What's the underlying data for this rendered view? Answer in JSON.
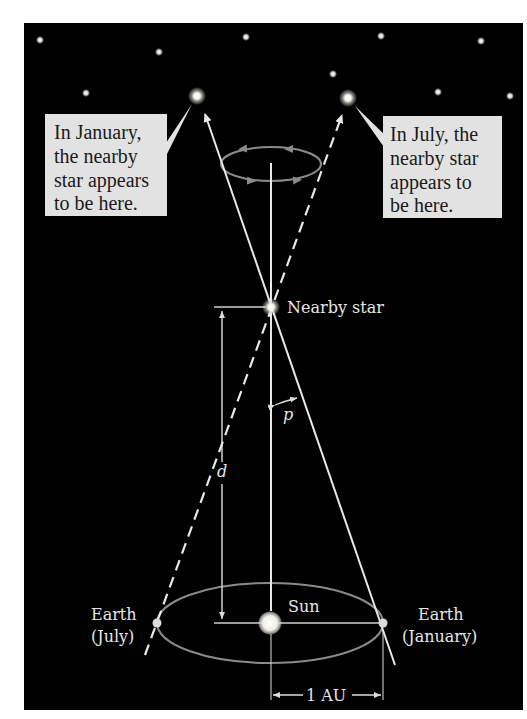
{
  "diagram": {
    "colors": {
      "background": "#000000",
      "page": "#ffffff",
      "line": "#e8e8e8",
      "orbit": "#8a8a8a",
      "callout_fill": "#e2e2e2",
      "callout_text": "#1a1a1a",
      "label_text": "#e6e6e6"
    },
    "callouts": {
      "january": {
        "lines": [
          "In January,",
          "the nearby",
          "star appears",
          "to be here."
        ]
      },
      "july": {
        "lines": [
          "In July, the",
          "nearby star",
          "appears to",
          "be here."
        ]
      }
    },
    "labels": {
      "nearby_star": "Nearby star",
      "sun": "Sun",
      "earth_july": [
        "Earth",
        "(July)"
      ],
      "earth_january": [
        "Earth",
        "(January)"
      ],
      "parallax_angle": "p",
      "distance": "d",
      "baseline": "1 AU"
    },
    "background_stars": [
      {
        "x": 40,
        "y": 40
      },
      {
        "x": 159,
        "y": 52
      },
      {
        "x": 246,
        "y": 37
      },
      {
        "x": 86,
        "y": 93
      },
      {
        "x": 381,
        "y": 36
      },
      {
        "x": 481,
        "y": 41
      },
      {
        "x": 333,
        "y": 74
      },
      {
        "x": 438,
        "y": 92
      },
      {
        "x": 510,
        "y": 96
      }
    ],
    "apparent_positions": [
      {
        "name": "january-apparent-star",
        "x": 197,
        "y": 96
      },
      {
        "name": "july-apparent-star",
        "x": 348,
        "y": 98
      }
    ]
  }
}
